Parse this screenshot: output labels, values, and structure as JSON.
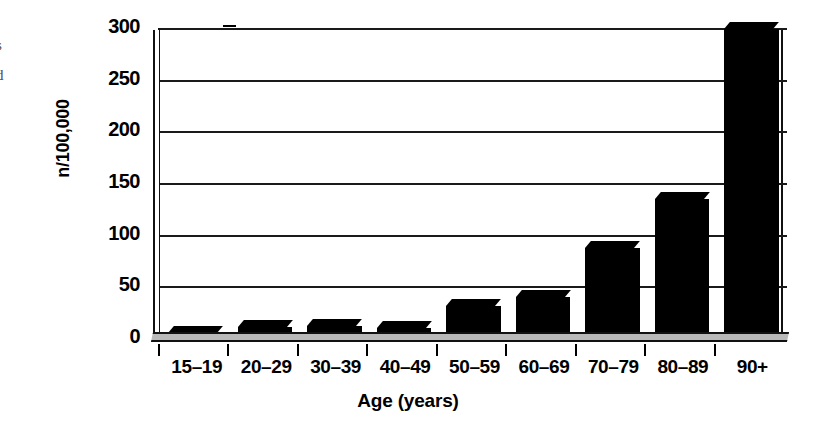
{
  "figure": {
    "edge_caption_fragments": [
      "s",
      "d"
    ]
  },
  "chart_data": {
    "type": "bar",
    "title": "",
    "subtitle": "",
    "xlabel": "Age (years)",
    "ylabel": "n/100,000",
    "categories": [
      "15–19",
      "20–29",
      "30–39",
      "40–49",
      "50–59",
      "60–69",
      "70–79",
      "80–89",
      "90+"
    ],
    "values": [
      3,
      9,
      10,
      8,
      29,
      38,
      85,
      133,
      297
    ],
    "ylim": [
      0,
      300
    ],
    "yticks": [
      0,
      50,
      100,
      150,
      200,
      250,
      300
    ],
    "ytick_labels": [
      "0",
      "50",
      "100",
      "150",
      "200",
      "250",
      "300"
    ],
    "grid": true,
    "grid_axis": "y",
    "legend": false,
    "legend_position": "none",
    "bar_color": "#000000",
    "plot_background": "#ffffff",
    "floor_color": "#b9b9b9",
    "style_3d": true,
    "series": [
      {
        "name": "Incidence rate",
        "values": [
          3,
          9,
          10,
          8,
          29,
          38,
          85,
          133,
          297
        ]
      }
    ]
  }
}
